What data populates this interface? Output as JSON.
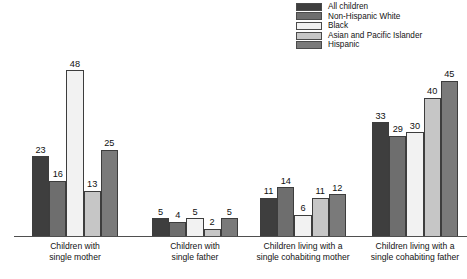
{
  "chart_data": {
    "type": "bar",
    "title": "",
    "subtitle": "",
    "xlabel": "",
    "ylabel": "t",
    "ylim": [
      0,
      50
    ],
    "grid": false,
    "legend_position": "top-right",
    "categories": [
      "Children with single mother",
      "Children with single father",
      "Children living with a single cohabiting mother",
      "Children living with a single cohabiting father"
    ],
    "category_lines": [
      [
        "Children with",
        "single mother"
      ],
      [
        "Children with",
        "single father"
      ],
      [
        "Children living with a",
        "single cohabiting mother"
      ],
      [
        "Children living with a",
        "single cohabiting father"
      ]
    ],
    "series": [
      {
        "name": "All children",
        "color": "#3e3e3e",
        "values": [
          23,
          5,
          11,
          33
        ]
      },
      {
        "name": "Non-Hispanic White",
        "color": "#6e6e6e",
        "values": [
          16,
          4,
          14,
          29
        ]
      },
      {
        "name": "Black",
        "color": "#f2f2f2",
        "values": [
          48,
          5,
          6,
          30
        ]
      },
      {
        "name": "Asian and Pacific Islander",
        "color": "#c6c6c6",
        "values": [
          13,
          2,
          11,
          40
        ]
      },
      {
        "name": "Hispanic",
        "color": "#7a7a7a",
        "values": [
          25,
          5,
          12,
          45
        ]
      }
    ]
  },
  "legend": {
    "items": [
      {
        "label": "All children",
        "color": "#3e3e3e"
      },
      {
        "label": "Non-Hispanic White",
        "color": "#6e6e6e"
      },
      {
        "label": "Black",
        "color": "#f2f2f2"
      },
      {
        "label": "Asian and Pacific Islander",
        "color": "#c6c6c6"
      },
      {
        "label": "Hispanic",
        "color": "#7a7a7a"
      }
    ]
  },
  "axis": {
    "ylabel_fragment": "t"
  }
}
